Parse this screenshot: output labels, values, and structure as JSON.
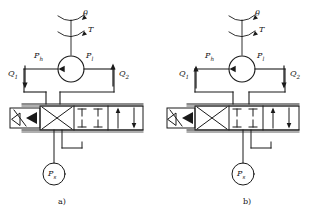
{
  "figure": {
    "type": "hydraulic-schematic",
    "panel_count": 2,
    "panels": [
      {
        "id": "a",
        "caption": "a)",
        "input_angle_label": "θ",
        "torque_label": "T",
        "port_high_label": "P",
        "port_high_sub": "h",
        "port_low_label": "P",
        "port_low_sub": "l",
        "flow1_label": "Q",
        "flow1_sub": "1",
        "flow1_direction": "down",
        "flow2_label": "Q",
        "flow2_sub": "2",
        "flow2_direction": "up",
        "supply_label": "P",
        "supply_sub": "s",
        "valve_positions": 3,
        "valve_active_position": "crossed",
        "actuator": "solenoid-with-spring"
      },
      {
        "id": "b",
        "caption": "b)",
        "input_angle_label": "θ",
        "torque_label": "T",
        "port_high_label": "P",
        "port_high_sub": "h",
        "port_low_label": "P",
        "port_low_sub": "l",
        "flow1_label": "Q",
        "flow1_sub": "1",
        "flow1_direction": "up",
        "flow2_label": "Q",
        "flow2_sub": "2",
        "flow2_direction": "down",
        "supply_label": "P",
        "supply_sub": "s",
        "valve_positions": 3,
        "valve_active_position": "parallel",
        "actuator": "solenoid-with-spring"
      }
    ],
    "colors": {
      "line": "#1a1a1a",
      "background": "#ffffff",
      "fill": "#1a1a1a"
    }
  }
}
